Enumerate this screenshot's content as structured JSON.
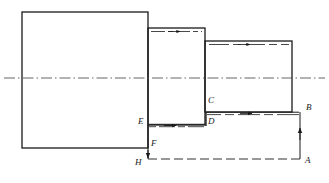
{
  "drawing": {
    "title": "Stepped shaft turning tool path diagram",
    "type": "engineering-drawing",
    "width": 329,
    "height": 183,
    "stroke_color": "#1a1a1a",
    "centerline_color": "#555555",
    "background": "#ffffff"
  },
  "labels": [
    {
      "id": "A",
      "text": "A",
      "x": 305,
      "y": 162
    },
    {
      "id": "B",
      "text": "B",
      "x": 306,
      "y": 108
    },
    {
      "id": "C",
      "text": "C",
      "x": 208,
      "y": 100
    },
    {
      "id": "D",
      "text": "D",
      "x": 208,
      "y": 121
    },
    {
      "id": "E",
      "text": "E",
      "x": 140,
      "y": 121
    },
    {
      "id": "F",
      "text": "F",
      "x": 151,
      "y": 143
    },
    {
      "id": "H",
      "text": "H",
      "x": 137,
      "y": 163
    }
  ],
  "bodies": [
    {
      "name": "stage-1-blank",
      "x": 22,
      "y": 12,
      "w": 126,
      "h": 136
    },
    {
      "name": "stage-2-step",
      "x": 148,
      "y": 28,
      "w": 57,
      "h": 97
    },
    {
      "name": "stage-3-step",
      "x": 205,
      "y": 41,
      "w": 87,
      "h": 71
    }
  ],
  "centerline": {
    "name": "axis-centerline",
    "x1": 4,
    "y1": 78,
    "x2": 325,
    "y2": 78
  },
  "toolpath": {
    "name": "tool-path",
    "segments": [
      {
        "from": "A",
        "to": "B",
        "dir": "up",
        "style": "solid",
        "x1": 300,
        "y1": 159,
        "x2": 300,
        "y2": 113
      },
      {
        "from": "B",
        "to": "C",
        "dir": "left",
        "style": "double",
        "x1": 300,
        "y1": 113,
        "x2": 206,
        "y2": 113
      },
      {
        "from": "C",
        "to": "D",
        "dir": "down",
        "style": "solid",
        "x1": 206,
        "y1": 113,
        "x2": 206,
        "y2": 125
      },
      {
        "from": "D",
        "to": "E",
        "dir": "left",
        "style": "double",
        "x1": 206,
        "y1": 125,
        "x2": 148,
        "y2": 125
      },
      {
        "from": "E",
        "to": "F",
        "dir": "down",
        "style": "solid",
        "x1": 148,
        "y1": 125,
        "x2": 148,
        "y2": 148
      },
      {
        "from": "F",
        "to": "H",
        "dir": "down",
        "style": "solid",
        "x1": 148,
        "y1": 148,
        "x2": 148,
        "y2": 159
      },
      {
        "from": "H",
        "to": "A",
        "dir": "right",
        "style": "dashed",
        "x1": 148,
        "y1": 159,
        "x2": 300,
        "y2": 159
      }
    ]
  },
  "cut_marks": [
    {
      "name": "cut-line-stage2-top",
      "x1": 150,
      "y1": 31,
      "x2": 203,
      "y2": 31,
      "arrow": "right"
    },
    {
      "name": "cut-line-stage3-top",
      "x1": 208,
      "y1": 44,
      "x2": 290,
      "y2": 44,
      "arrow": "right"
    },
    {
      "name": "cut-line-CB",
      "x1": 208,
      "y1": 113,
      "x2": 298,
      "y2": 113,
      "arrow": "right"
    },
    {
      "name": "cut-line-DE",
      "x1": 150,
      "y1": 125,
      "x2": 204,
      "y2": 125,
      "arrow": "right"
    }
  ]
}
